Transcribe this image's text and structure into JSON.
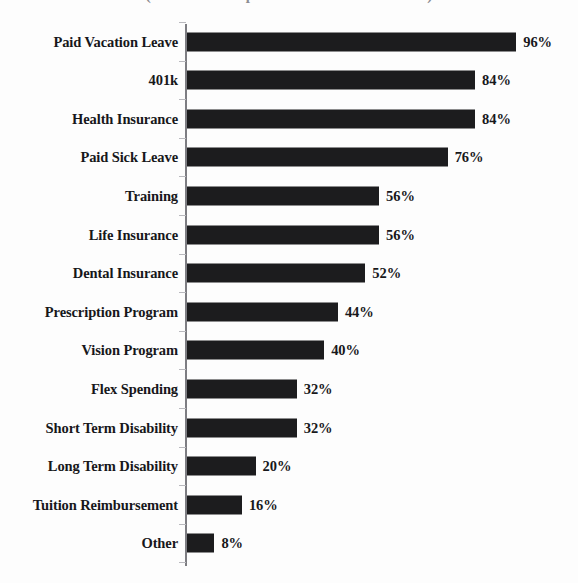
{
  "chart_data": {
    "type": "bar",
    "orientation": "horizontal",
    "title": "(Percent of Respondents that Offer Benefit)",
    "xlabel": "",
    "ylabel": "",
    "xlim": [
      0,
      100
    ],
    "grid": false,
    "legend": null,
    "value_suffix": "%",
    "categories": [
      "Paid Vacation Leave",
      "401k",
      "Health Insurance",
      "Paid Sick Leave",
      "Training",
      "Life Insurance",
      "Dental Insurance",
      "Prescription Program",
      "Vision Program",
      "Flex Spending",
      "Short Term Disability",
      "Long Term Disability",
      "Tuition Reimbursement",
      "Other"
    ],
    "values": [
      96,
      84,
      84,
      76,
      56,
      56,
      52,
      44,
      40,
      32,
      32,
      20,
      16,
      8
    ],
    "value_labels": [
      "96%",
      "84%",
      "84%",
      "76%",
      "56%",
      "56%",
      "52%",
      "44%",
      "40%",
      "32%",
      "32%",
      "20%",
      "16%",
      "8%"
    ],
    "bar_color": "#1c1c1e",
    "axis_color": "#7d7d82"
  }
}
